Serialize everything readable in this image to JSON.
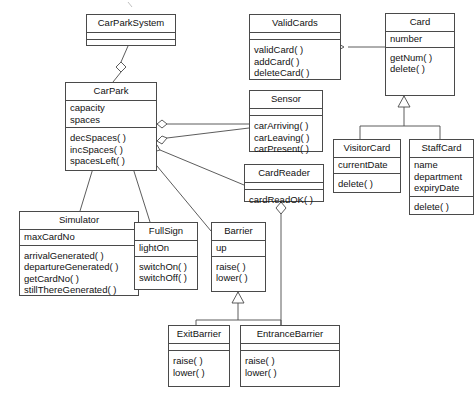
{
  "diagram": {
    "type": "uml-class-diagram",
    "classes": [
      {
        "id": "carparksystem",
        "name": "CarParkSystem",
        "attributes": [],
        "operations": []
      },
      {
        "id": "carpark",
        "name": "CarPark",
        "attributes": [
          "capacity",
          "spaces"
        ],
        "operations": [
          "decSpaces( )",
          "incSpaces( )",
          "spacesLeft( )"
        ]
      },
      {
        "id": "validcards",
        "name": "ValidCards",
        "attributes": [],
        "operations": [
          "validCard( )",
          "addCard( )",
          "deleteCard( )"
        ]
      },
      {
        "id": "card",
        "name": "Card",
        "attributes": [
          "number"
        ],
        "operations": [
          "getNum( )",
          "delete( )"
        ]
      },
      {
        "id": "sensor",
        "name": "Sensor",
        "attributes": [],
        "operations": [
          "carArriving( )",
          "carLeaving( )",
          "carPresent( )"
        ]
      },
      {
        "id": "cardreader",
        "name": "CardReader",
        "attributes": [],
        "operations": [
          "cardReadOK( )"
        ]
      },
      {
        "id": "visitorcard",
        "name": "VisitorCard",
        "attributes": [
          "currentDate"
        ],
        "operations": [
          "delete( )"
        ]
      },
      {
        "id": "staffcard",
        "name": "StaffCard",
        "attributes": [
          "name",
          "department",
          "expiryDate"
        ],
        "operations": [
          "delete( )"
        ]
      },
      {
        "id": "simulator",
        "name": "Simulator",
        "attributes": [
          "maxCardNo"
        ],
        "operations": [
          "arrivalGenerated( )",
          "departureGenerated( )",
          "getCardNo( )",
          "stillThereGenerated( )"
        ]
      },
      {
        "id": "fullsign",
        "name": "FullSign",
        "attributes": [
          "lightOn"
        ],
        "operations": [
          "switchOn( )",
          "switchOff( )"
        ]
      },
      {
        "id": "barrier",
        "name": "Barrier",
        "attributes": [
          "up"
        ],
        "operations": [
          "raise( )",
          "lower( )"
        ]
      },
      {
        "id": "exitbarrier",
        "name": "ExitBarrier",
        "attributes": [],
        "operations": [
          "raise( )",
          "lower( )"
        ]
      },
      {
        "id": "entrancebarrier",
        "name": "EntranceBarrier",
        "attributes": [],
        "operations": [
          "raise( )",
          "lower( )"
        ]
      }
    ],
    "relationships": [
      {
        "kind": "aggregation",
        "from": "carparksystem",
        "to": "carpark"
      },
      {
        "kind": "aggregation",
        "from": "carpark",
        "to": "sensor"
      },
      {
        "kind": "aggregation",
        "from": "carpark",
        "to": "cardreader"
      },
      {
        "kind": "aggregation",
        "from": "carpark",
        "to": "validcards"
      },
      {
        "kind": "aggregation",
        "from": "carpark",
        "to": "barrier"
      },
      {
        "kind": "aggregation",
        "from": "carpark",
        "to": "fullsign"
      },
      {
        "kind": "aggregation",
        "from": "carpark",
        "to": "simulator"
      },
      {
        "kind": "aggregation",
        "from": "validcards",
        "to": "card"
      },
      {
        "kind": "generalization",
        "from": "visitorcard",
        "to": "card"
      },
      {
        "kind": "generalization",
        "from": "staffcard",
        "to": "card"
      },
      {
        "kind": "generalization",
        "from": "exitbarrier",
        "to": "barrier"
      },
      {
        "kind": "generalization",
        "from": "entrancebarrier",
        "to": "barrier"
      },
      {
        "kind": "aggregation",
        "from": "cardreader",
        "to": "entrancebarrier"
      }
    ],
    "colors": {
      "line": "#4a4a4a",
      "text": "#111111",
      "background": "#ffffff"
    }
  }
}
